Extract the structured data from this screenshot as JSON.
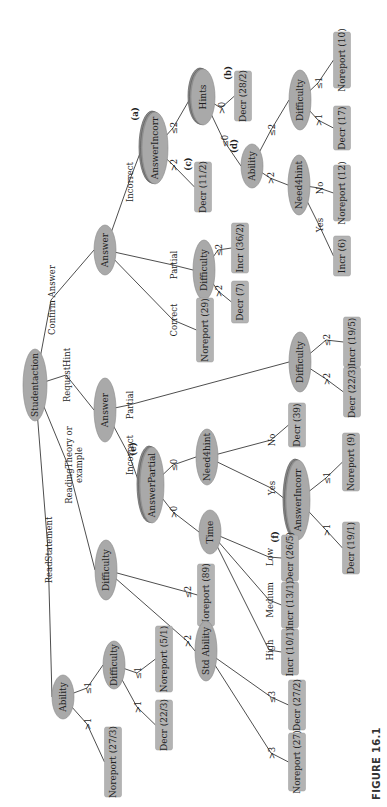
{
  "figure": {
    "caption": "FIGURE 16.1",
    "orientation": "rotated-90-ccw"
  },
  "colors": {
    "node_fill": "#a9a9a9",
    "stacked_node_fill": "#8f8f8f",
    "leaf_fill": "#b3b3b3",
    "edge": "#3a3a3a",
    "text": "#1e1e1e"
  },
  "nodes": [
    {
      "id": "root",
      "label": "Studentaction",
      "kind": "ellipse",
      "x": 35,
      "y": 385,
      "rx": 12,
      "ry": 36
    },
    {
      "id": "ans1",
      "label": "Answer",
      "kind": "ellipse",
      "x": 105,
      "y": 250,
      "rx": 11,
      "ry": 25
    },
    {
      "id": "ainc1",
      "label": "AnswerIncorr",
      "kind": "stack",
      "x": 155,
      "y": 148,
      "rx": 13,
      "ry": 36,
      "tag": "(a)"
    },
    {
      "id": "hints",
      "label": "Hints",
      "kind": "stack",
      "x": 203,
      "y": 97,
      "rx": 12,
      "ry": 28
    },
    {
      "id": "l_decr282",
      "label": "Decr (28/2)",
      "kind": "leaf",
      "x": 243,
      "y": 96,
      "w": 17,
      "h": 50,
      "tag": "(b)"
    },
    {
      "id": "l_decr112",
      "label": "Decr (11/2)",
      "kind": "leaf",
      "x": 203,
      "y": 187,
      "w": 17,
      "h": 50,
      "tag": "(c)"
    },
    {
      "id": "ability1",
      "label": "Ability",
      "kind": "ellipse",
      "x": 252,
      "y": 166,
      "rx": 11,
      "ry": 22,
      "tag": "(d)"
    },
    {
      "id": "need1",
      "label": "Need4hint",
      "kind": "ellipse",
      "x": 299,
      "y": 185,
      "rx": 11,
      "ry": 30
    },
    {
      "id": "diff1",
      "label": "Difficulty",
      "kind": "ellipse",
      "x": 300,
      "y": 100,
      "rx": 11,
      "ry": 30
    },
    {
      "id": "l_decr17",
      "label": "Decr (17)",
      "kind": "leaf",
      "x": 342,
      "y": 128,
      "w": 17,
      "h": 44
    },
    {
      "id": "l_nor10",
      "label": "Noreport (10)",
      "kind": "leaf",
      "x": 342,
      "y": 60,
      "w": 17,
      "h": 56
    },
    {
      "id": "l_nor12",
      "label": "Noreport (12)",
      "kind": "leaf",
      "x": 342,
      "y": 193,
      "w": 17,
      "h": 56
    },
    {
      "id": "l_incr6",
      "label": "Incr (6)",
      "kind": "leaf",
      "x": 342,
      "y": 256,
      "w": 17,
      "h": 40
    },
    {
      "id": "diff2",
      "label": "Difficulty",
      "kind": "ellipse",
      "x": 204,
      "y": 270,
      "rx": 11,
      "ry": 30
    },
    {
      "id": "l_incr362",
      "label": "Incr (36/2)",
      "kind": "leaf",
      "x": 240,
      "y": 248,
      "w": 17,
      "h": 50
    },
    {
      "id": "l_decr7",
      "label": "Decr (7)",
      "kind": "leaf",
      "x": 240,
      "y": 302,
      "w": 17,
      "h": 42
    },
    {
      "id": "l_nor29",
      "label": "Noreport (29)",
      "kind": "leaf",
      "x": 205,
      "y": 330,
      "w": 17,
      "h": 64
    },
    {
      "id": "ans2",
      "label": "Answer",
      "kind": "ellipse",
      "x": 105,
      "y": 410,
      "rx": 11,
      "ry": 32
    },
    {
      "id": "diff3",
      "label": "Difficulty",
      "kind": "ellipse",
      "x": 300,
      "y": 362,
      "rx": 11,
      "ry": 30
    },
    {
      "id": "l_incr195",
      "label": "Incr (19/5)",
      "kind": "leaf",
      "x": 352,
      "y": 342,
      "w": 17,
      "h": 50
    },
    {
      "id": "l_decr223a",
      "label": "Decr (22/3)",
      "kind": "leaf",
      "x": 352,
      "y": 392,
      "w": 17,
      "h": 50
    },
    {
      "id": "apart",
      "label": "AnswerPartial",
      "kind": "stack",
      "x": 152,
      "y": 485,
      "rx": 12,
      "ry": 38,
      "tag": "(e)"
    },
    {
      "id": "need2",
      "label": "Need4hint",
      "kind": "ellipse",
      "x": 207,
      "y": 457,
      "rx": 11,
      "ry": 28
    },
    {
      "id": "l_decr39",
      "label": "Decr (39)",
      "kind": "leaf",
      "x": 297,
      "y": 425,
      "w": 17,
      "h": 44
    },
    {
      "id": "ainc2",
      "label": "AnswerIncorr",
      "kind": "stack",
      "x": 298,
      "y": 500,
      "rx": 12,
      "ry": 40
    },
    {
      "id": "l_nor9",
      "label": "Noreport (9)",
      "kind": "leaf",
      "x": 351,
      "y": 462,
      "w": 17,
      "h": 58
    },
    {
      "id": "l_decr191",
      "label": "Decr (19/1)",
      "kind": "leaf",
      "x": 351,
      "y": 548,
      "w": 17,
      "h": 52
    },
    {
      "id": "time",
      "label": "Time",
      "kind": "ellipse",
      "x": 210,
      "y": 532,
      "rx": 11,
      "ry": 22
    },
    {
      "id": "l_decr265",
      "label": "Decr (26/5)",
      "kind": "leaf",
      "x": 290,
      "y": 558,
      "w": 17,
      "h": 46,
      "tag": "(f)"
    },
    {
      "id": "l_incr131",
      "label": "Incr (13/1)",
      "kind": "leaf",
      "x": 290,
      "y": 605,
      "w": 17,
      "h": 46
    },
    {
      "id": "l_incr101",
      "label": "Incr (10/1)",
      "kind": "leaf",
      "x": 290,
      "y": 652,
      "w": 17,
      "h": 46
    },
    {
      "id": "diff4",
      "label": "Difficulty",
      "kind": "ellipse",
      "x": 106,
      "y": 570,
      "rx": 11,
      "ry": 30
    },
    {
      "id": "l_nor89",
      "label": "Noreport (89)",
      "kind": "leaf",
      "x": 206,
      "y": 595,
      "w": 17,
      "h": 62
    },
    {
      "id": "stdab",
      "label": "Std Ability",
      "kind": "ellipse",
      "x": 206,
      "y": 651,
      "rx": 11,
      "ry": 30
    },
    {
      "id": "l_decr272",
      "label": "Decr (27/2)",
      "kind": "leaf",
      "x": 297,
      "y": 705,
      "w": 17,
      "h": 50
    },
    {
      "id": "l_nor27",
      "label": "Noreport (27)",
      "kind": "leaf",
      "x": 297,
      "y": 762,
      "w": 17,
      "h": 58
    },
    {
      "id": "ability2",
      "label": "Ability",
      "kind": "ellipse",
      "x": 63,
      "y": 697,
      "rx": 11,
      "ry": 22
    },
    {
      "id": "diff5",
      "label": "Difficulty",
      "kind": "ellipse",
      "x": 114,
      "y": 665,
      "rx": 11,
      "ry": 24
    },
    {
      "id": "l_nor51",
      "label": "Noreport (5/1)",
      "kind": "leaf",
      "x": 164,
      "y": 659,
      "w": 17,
      "h": 66
    },
    {
      "id": "l_decr223b",
      "label": "Decr (22/3)",
      "kind": "leaf",
      "x": 164,
      "y": 725,
      "w": 17,
      "h": 50
    },
    {
      "id": "l_nor273",
      "label": "Noreport (27/3)",
      "kind": "leaf",
      "x": 113,
      "y": 762,
      "w": 17,
      "h": 70
    }
  ],
  "edges": [
    {
      "from": "root",
      "to": "ans1",
      "label": "Confirm Answer",
      "lx": 55,
      "ly": 300
    },
    {
      "from": "root",
      "to": "ans2",
      "label": "RequestHint",
      "lx": 70,
      "ly": 375
    },
    {
      "from": "root",
      "to": "diff4",
      "label": "ReadingTheory or\nexample",
      "lx": 72,
      "ly": 465
    },
    {
      "from": "root",
      "to": "ability2",
      "label": "ReadStatement",
      "lx": 52,
      "ly": 550
    },
    {
      "from": "ans1",
      "to": "ainc1",
      "label": "Incorrect",
      "lx": 133,
      "ly": 182
    },
    {
      "from": "ans1",
      "to": "diff2",
      "label": "Partial",
      "lx": 177,
      "ly": 265
    },
    {
      "from": "ans1",
      "to": "l_nor29",
      "label": "Correct",
      "lx": 177,
      "ly": 320
    },
    {
      "from": "ainc1",
      "to": "hints",
      "label": "≤2",
      "lx": 177,
      "ly": 128
    },
    {
      "from": "ainc1",
      "to": "l_decr112",
      "label": ">2",
      "lx": 177,
      "ly": 165
    },
    {
      "from": "hints",
      "to": "l_decr282",
      "label": ">0",
      "lx": 225,
      "ly": 108
    },
    {
      "from": "hints",
      "to": "ability1",
      "label": "≤0",
      "lx": 228,
      "ly": 141
    },
    {
      "from": "ability1",
      "to": "diff1",
      "label": "≤2",
      "lx": 275,
      "ly": 130
    },
    {
      "from": "ability1",
      "to": "need1",
      "label": ">2",
      "lx": 274,
      "ly": 178
    },
    {
      "from": "diff1",
      "to": "l_decr17",
      "label": ">1",
      "lx": 322,
      "ly": 120
    },
    {
      "from": "diff1",
      "to": "l_nor10",
      "label": "≤1",
      "lx": 322,
      "ly": 83
    },
    {
      "from": "need1",
      "to": "l_nor12",
      "label": "No",
      "lx": 323,
      "ly": 188
    },
    {
      "from": "need1",
      "to": "l_incr6",
      "label": "Yes",
      "lx": 323,
      "ly": 225
    },
    {
      "from": "diff2",
      "to": "l_incr362",
      "label": "≤2",
      "lx": 222,
      "ly": 250
    },
    {
      "from": "diff2",
      "to": "l_decr7",
      "label": ">2",
      "lx": 222,
      "ly": 291
    },
    {
      "from": "ans2",
      "to": "apart",
      "label": "Incorrect",
      "lx": 133,
      "ly": 455
    },
    {
      "from": "ans2",
      "to": "diff3",
      "label": "Partial",
      "lx": 133,
      "ly": 405
    },
    {
      "from": "diff3",
      "to": "l_incr195",
      "label": "≤2",
      "lx": 330,
      "ly": 340
    },
    {
      "from": "diff3",
      "to": "l_decr223a",
      "label": ">2",
      "lx": 330,
      "ly": 379
    },
    {
      "from": "apart",
      "to": "need2",
      "label": "≤0",
      "lx": 177,
      "ly": 465
    },
    {
      "from": "apart",
      "to": "time",
      "label": ">0",
      "lx": 177,
      "ly": 512
    },
    {
      "from": "need2",
      "to": "l_decr39",
      "label": "No",
      "lx": 275,
      "ly": 440
    },
    {
      "from": "need2",
      "to": "ainc2",
      "label": "Yes",
      "lx": 275,
      "ly": 488
    },
    {
      "from": "ainc2",
      "to": "l_nor9",
      "label": "≤1",
      "lx": 330,
      "ly": 478
    },
    {
      "from": "ainc2",
      "to": "l_decr191",
      "label": ">1",
      "lx": 330,
      "ly": 530
    },
    {
      "from": "time",
      "to": "l_decr265",
      "label": "Low",
      "lx": 273,
      "ly": 557
    },
    {
      "from": "time",
      "to": "l_incr131",
      "label": "Medium",
      "lx": 273,
      "ly": 600
    },
    {
      "from": "time",
      "to": "l_incr101",
      "label": "High",
      "lx": 273,
      "ly": 650
    },
    {
      "from": "diff4",
      "to": "l_nor89",
      "label": "≤2",
      "lx": 191,
      "ly": 592
    },
    {
      "from": "diff4",
      "to": "stdab",
      "label": ">2",
      "lx": 191,
      "ly": 641
    },
    {
      "from": "stdab",
      "to": "l_decr272",
      "label": "≤3",
      "lx": 275,
      "ly": 697
    },
    {
      "from": "stdab",
      "to": "l_nor27",
      "label": ">3",
      "lx": 275,
      "ly": 753
    },
    {
      "from": "ability2",
      "to": "diff5",
      "label": "≤1",
      "lx": 91,
      "ly": 688
    },
    {
      "from": "ability2",
      "to": "l_nor273",
      "label": ">1",
      "lx": 91,
      "ly": 724
    },
    {
      "from": "diff5",
      "to": "l_nor51",
      "label": "≤1",
      "lx": 141,
      "ly": 673
    },
    {
      "from": "diff5",
      "to": "l_decr223b",
      "label": ">1",
      "lx": 141,
      "ly": 707
    }
  ]
}
